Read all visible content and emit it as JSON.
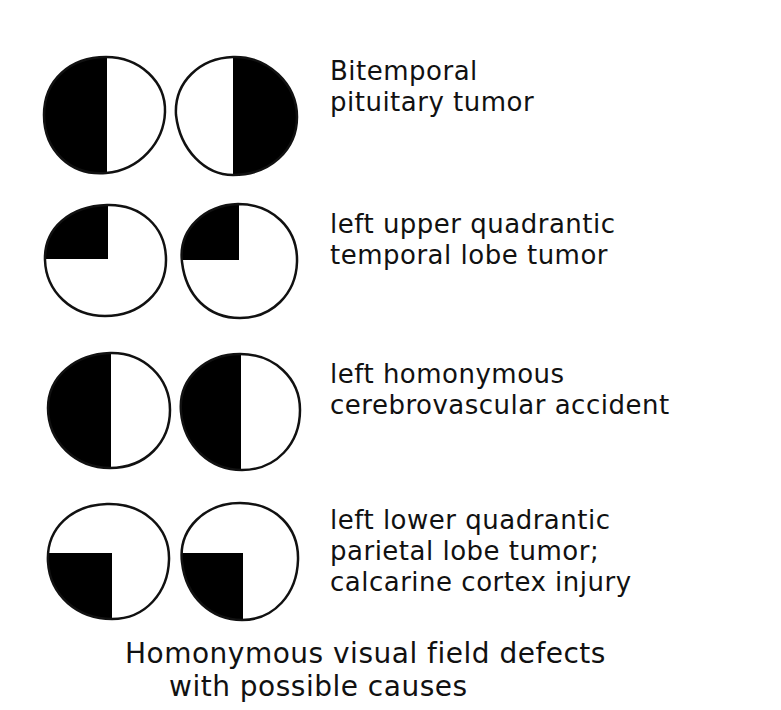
{
  "figure": {
    "caption": {
      "line1": "Homonymous visual field defects",
      "line2": "with possible causes"
    },
    "colors": {
      "defect_fill": "#000000",
      "field_fill": "#ffffff",
      "outline": "#111111",
      "background": "#ffffff"
    },
    "rows": [
      {
        "defect": "bitemporal hemianopia",
        "left_eye_blind_region": "left half",
        "right_eye_blind_region": "right half",
        "label_line1": "Bitemporal",
        "label_line2": "pituitary tumor",
        "label_line3": ""
      },
      {
        "defect": "left upper quadrantanopia",
        "left_eye_blind_region": "upper-left quadrant",
        "right_eye_blind_region": "upper-left quadrant",
        "label_line1": "left upper quadrantic",
        "label_line2": "temporal lobe tumor",
        "label_line3": ""
      },
      {
        "defect": "left homonymous hemianopia",
        "left_eye_blind_region": "left half",
        "right_eye_blind_region": "left half",
        "label_line1": "left homonymous",
        "label_line2": "cerebrovascular accident",
        "label_line3": ""
      },
      {
        "defect": "left lower quadrantanopia",
        "left_eye_blind_region": "lower-left quadrant",
        "right_eye_blind_region": "lower-left quadrant",
        "label_line1": "left lower quadrantic",
        "label_line2": "parietal lobe tumor;",
        "label_line3": "calcarine cortex injury"
      }
    ]
  }
}
